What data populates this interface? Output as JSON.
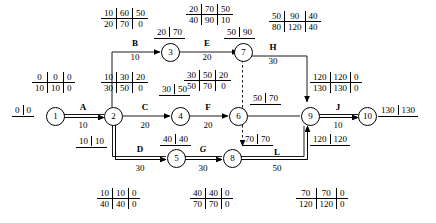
{
  "diagram": {
    "nodes": [
      {
        "id": "n1",
        "label": "1"
      },
      {
        "id": "n2",
        "label": "2"
      },
      {
        "id": "n3",
        "label": "3"
      },
      {
        "id": "n4",
        "label": "4"
      },
      {
        "id": "n5",
        "label": "5"
      },
      {
        "id": "n6",
        "label": "6"
      },
      {
        "id": "n7",
        "label": "7"
      },
      {
        "id": "n8",
        "label": "8"
      },
      {
        "id": "n9",
        "label": "9"
      },
      {
        "id": "n10",
        "label": "10"
      }
    ],
    "activities": [
      {
        "id": "A",
        "name": "A",
        "duration": "10",
        "italic": false
      },
      {
        "id": "B",
        "name": "B",
        "duration": "10",
        "italic": false
      },
      {
        "id": "C",
        "name": "C",
        "duration": "20",
        "italic": false
      },
      {
        "id": "D",
        "name": "D",
        "duration": "30",
        "italic": false
      },
      {
        "id": "E",
        "name": "E",
        "duration": "20",
        "italic": false
      },
      {
        "id": "F",
        "name": "F",
        "duration": "20",
        "italic": false
      },
      {
        "id": "G",
        "name": "G",
        "duration": "30",
        "italic": true
      },
      {
        "id": "H",
        "name": "H",
        "duration": "30",
        "italic": false
      },
      {
        "id": "J",
        "name": "J",
        "duration": "10",
        "italic": false
      },
      {
        "id": "L",
        "name": "L",
        "duration": "50",
        "italic": false
      }
    ],
    "tables": [
      {
        "id": "tbl_B",
        "for": "B",
        "top": [
          "10",
          "60",
          "50"
        ],
        "bottom": [
          "20",
          "70",
          "0"
        ]
      },
      {
        "id": "tbl_E",
        "for": "E",
        "top": [
          "20",
          "70",
          "50"
        ],
        "bottom": [
          "40",
          "90",
          "10"
        ]
      },
      {
        "id": "tbl_H",
        "for": "H",
        "top": [
          "50",
          "90",
          "40"
        ],
        "bottom": [
          "80",
          "120",
          "40"
        ]
      },
      {
        "id": "tbl_C",
        "for": "C",
        "top": [
          "10",
          "30",
          "20"
        ],
        "bottom": [
          "30",
          "50",
          "0"
        ]
      },
      {
        "id": "tbl_F",
        "for": "F",
        "top": [
          "30",
          "50",
          "20"
        ],
        "bottom": [
          "50",
          "70",
          "0"
        ]
      },
      {
        "id": "tbl_J",
        "for": "J",
        "top": [
          "120",
          "120",
          "0"
        ],
        "bottom": [
          "130",
          "130",
          "0"
        ]
      },
      {
        "id": "tbl_A",
        "for": "A",
        "top": [
          "0",
          "0",
          "0"
        ],
        "bottom": [
          "10",
          "10",
          "0"
        ]
      },
      {
        "id": "tbl_D",
        "for": "D",
        "top": [
          "10",
          "10",
          "0"
        ],
        "bottom": [
          "40",
          "40",
          "0"
        ]
      },
      {
        "id": "tbl_G",
        "for": "G",
        "top": [
          "40",
          "40",
          "0"
        ],
        "bottom": [
          "70",
          "70",
          "0"
        ]
      },
      {
        "id": "tbl_L",
        "for": "L",
        "top": [
          "70",
          "70",
          "0"
        ],
        "bottom": [
          "120",
          "120",
          "0"
        ]
      }
    ],
    "pairs": [
      {
        "id": "pair_n1",
        "left": "0",
        "right": "0"
      },
      {
        "id": "pair_n2",
        "left": "10",
        "right": "10"
      },
      {
        "id": "pair_n3",
        "left": "20",
        "right": "70"
      },
      {
        "id": "pair_n4",
        "left": "30",
        "right": "50"
      },
      {
        "id": "pair_n5",
        "left": "40",
        "right": "40"
      },
      {
        "id": "pair_n6",
        "left": "50",
        "right": "70"
      },
      {
        "id": "pair_n7",
        "left": "50",
        "right": "90"
      },
      {
        "id": "pair_n8",
        "left": "70",
        "right": "70"
      },
      {
        "id": "pair_n9",
        "left": "120",
        "right": "120"
      },
      {
        "id": "pair_n10",
        "left": "130",
        "right": "130"
      }
    ]
  }
}
